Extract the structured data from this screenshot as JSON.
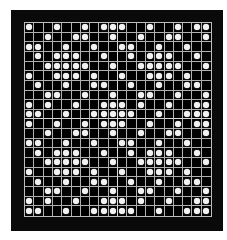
{
  "figure": {
    "rows": 20,
    "cols": 20,
    "tile_size": 10,
    "colors": {
      "frame": "#0a0a0a",
      "cell": "#000000",
      "grid_line": "#b0b0b0",
      "dot": "#f2f2f2"
    },
    "tile_pattern": [
      [
        1,
        0,
        0,
        1,
        0,
        0,
        1,
        0,
        1,
        1
      ],
      [
        0,
        0,
        1,
        0,
        0,
        1,
        1,
        0,
        0,
        1
      ],
      [
        1,
        1,
        0,
        0,
        1,
        0,
        0,
        1,
        0,
        0
      ],
      [
        0,
        1,
        0,
        1,
        1,
        1,
        0,
        0,
        1,
        0
      ],
      [
        0,
        0,
        1,
        1,
        1,
        1,
        1,
        0,
        0,
        1
      ],
      [
        1,
        0,
        0,
        1,
        1,
        1,
        0,
        1,
        0,
        0
      ],
      [
        0,
        1,
        0,
        0,
        1,
        0,
        0,
        1,
        1,
        0
      ],
      [
        0,
        0,
        1,
        1,
        0,
        0,
        1,
        0,
        0,
        1
      ],
      [
        1,
        0,
        1,
        0,
        0,
        1,
        0,
        0,
        1,
        1
      ],
      [
        1,
        1,
        0,
        0,
        1,
        0,
        0,
        1,
        1,
        1
      ]
    ]
  }
}
